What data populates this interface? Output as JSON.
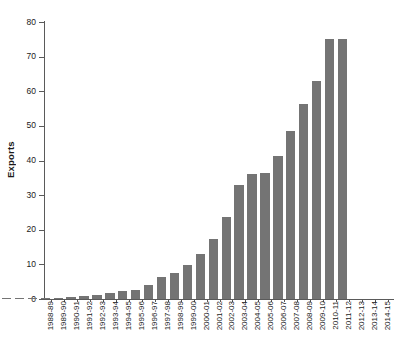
{
  "chart_data": {
    "type": "bar",
    "title": "",
    "xlabel": "",
    "ylabel": "Exports",
    "ylim": [
      0,
      80
    ],
    "yticks": [
      0,
      10,
      20,
      30,
      40,
      50,
      60,
      70,
      80
    ],
    "grid": false,
    "legend": null,
    "bar_color": "#747474",
    "axis_color": "#5a5a5a",
    "categories": [
      "1988-89",
      "1989-90",
      "1990-91",
      "1991-92",
      "1992-93",
      "1993-94",
      "1994-95",
      "1995-96",
      "1996-97",
      "1997-98",
      "1998-99",
      "1999-00",
      "2000-01",
      "2001-02",
      "2002-03",
      "2003-04",
      "2004-05",
      "2005-06",
      "2006-07",
      "2007-08",
      "2008-09",
      "2009-10",
      "2010-11",
      "2011-12",
      "2012-13",
      "2013-14",
      "2014-15"
    ],
    "values": [
      0.2,
      0.2,
      0.3,
      0.3,
      0.4,
      0.5,
      0.8,
      1.1,
      1.8,
      2.3,
      2.7,
      4.0,
      6.3,
      7.6,
      9.9,
      12.9,
      17.2,
      23.6,
      33.0,
      36.0,
      36.3,
      41.4,
      48.5,
      56.3,
      63.0,
      75.0,
      75.0
    ]
  }
}
